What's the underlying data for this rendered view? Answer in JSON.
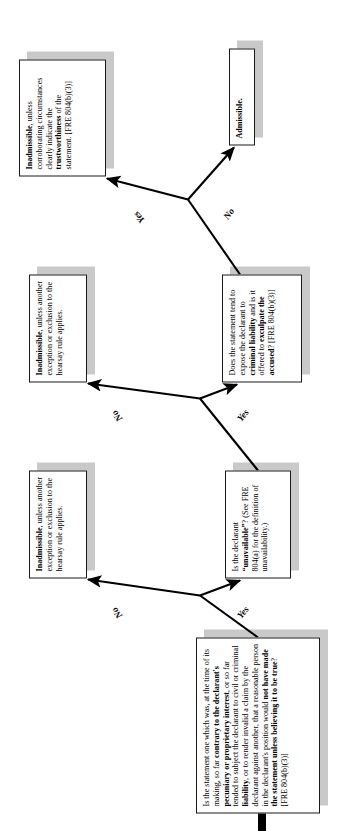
{
  "diagram": {
    "nodes": {
      "q1": {
        "id": "statement-against-interest-question",
        "type": "decision",
        "segments": [
          {
            "text": "Is the statement one which was, at the time of its making, so far ",
            "bold": false
          },
          {
            "text": "contrary to the declarant's pecuniary or proprietary interest",
            "bold": true
          },
          {
            "text": ", or so far tended to subject the declarant to civil or criminal ",
            "bold": false
          },
          {
            "text": "liability",
            "bold": true
          },
          {
            "text": ", or to render invalid a claim by the declarant against another, that a reasonable person in the declarant's position would ",
            "bold": false
          },
          {
            "text": "not have made the statement unless believing it to be true",
            "bold": true
          },
          {
            "text": "? [FRE 804(b)(3)]",
            "bold": false
          }
        ]
      },
      "inadm1": {
        "id": "inadmissible-no-exception-1",
        "type": "terminal",
        "segments": [
          {
            "text": "Inadmissible",
            "bold": true
          },
          {
            "text": ", unless another exception or exclusion to the hearsay rule applies.",
            "bold": false
          }
        ]
      },
      "q2": {
        "id": "declarant-unavailable-question",
        "type": "decision",
        "segments": [
          {
            "text": "Is the declarant ",
            "bold": false
          },
          {
            "text": "“unavailable”",
            "bold": true
          },
          {
            "text": "? (See FRE 804(a) for the definition of unavailability.)",
            "bold": false
          }
        ]
      },
      "inadm2": {
        "id": "inadmissible-no-exception-2",
        "type": "terminal",
        "segments": [
          {
            "text": "Inadmissible",
            "bold": true
          },
          {
            "text": ", unless another exception or exclusion to the hearsay rule applies.",
            "bold": false
          }
        ]
      },
      "q3": {
        "id": "exculpate-accused-question",
        "type": "decision",
        "segments": [
          {
            "text": "Does the statement tend to expose the declarant to ",
            "bold": false
          },
          {
            "text": "criminal liability",
            "bold": true
          },
          {
            "text": " and is it offered to ",
            "bold": false
          },
          {
            "text": "exculpate the accused",
            "bold": true
          },
          {
            "text": "? [FRE 804(b)(3)]",
            "bold": false
          }
        ]
      },
      "inadm3": {
        "id": "inadmissible-unless-corroborating",
        "type": "terminal",
        "segments": [
          {
            "text": "Inadmissible",
            "bold": true
          },
          {
            "text": ", unless corroborating circumstances clearly indicate the ",
            "bold": false
          },
          {
            "text": "trustworthiness",
            "bold": true
          },
          {
            "text": " of the statement. [FRE 804(b)(3)]",
            "bold": false
          }
        ]
      },
      "admissible": {
        "id": "admissible-terminal",
        "type": "terminal",
        "segments": [
          {
            "text": "Admissible.",
            "bold": true
          }
        ]
      }
    },
    "edges": [
      {
        "from": "q1",
        "to": "inadm1",
        "label": "No"
      },
      {
        "from": "q1",
        "to": "q2",
        "label": "Yes"
      },
      {
        "from": "q2",
        "to": "inadm2",
        "label": "No"
      },
      {
        "from": "q2",
        "to": "q3",
        "label": "Yes"
      },
      {
        "from": "q3",
        "to": "inadm3",
        "label": "Yes"
      },
      {
        "from": "q3",
        "to": "admissible",
        "label": "No"
      }
    ],
    "entry_arrow": "entry-arrow",
    "colors": {
      "box_fill": "#ffffff",
      "box_border": "#1a1a1a",
      "shadow": "#c9c9c9",
      "text": "#000000",
      "arrow": "#000000"
    }
  }
}
